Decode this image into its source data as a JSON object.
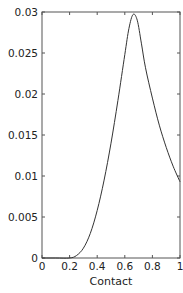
{
  "chart_data": {
    "type": "line",
    "title": "",
    "xlabel": "Contact",
    "ylabel": "",
    "xlim": [
      0,
      1
    ],
    "ylim": [
      0,
      0.03
    ],
    "grid": false,
    "legend": null,
    "x_ticks": [
      "0",
      "0.2",
      "0.4",
      "0.6",
      "0.8",
      "1"
    ],
    "y_ticks": [
      "0",
      "0.005",
      "0.01",
      "0.015",
      "0.02",
      "0.025",
      "0.03"
    ],
    "series": [
      {
        "name": "density",
        "x": [
          0,
          0.1,
          0.2,
          0.25,
          0.3,
          0.35,
          0.4,
          0.45,
          0.5,
          0.55,
          0.6,
          0.63,
          0.66,
          0.69,
          0.72,
          0.75,
          0.8,
          0.85,
          0.9,
          0.95,
          1.0
        ],
        "y": [
          0,
          0,
          0,
          0.0003,
          0.0012,
          0.003,
          0.0058,
          0.0095,
          0.014,
          0.0192,
          0.0248,
          0.028,
          0.0297,
          0.029,
          0.0262,
          0.0232,
          0.0195,
          0.0162,
          0.0135,
          0.0112,
          0.0093
        ]
      }
    ],
    "color": "#333333"
  }
}
